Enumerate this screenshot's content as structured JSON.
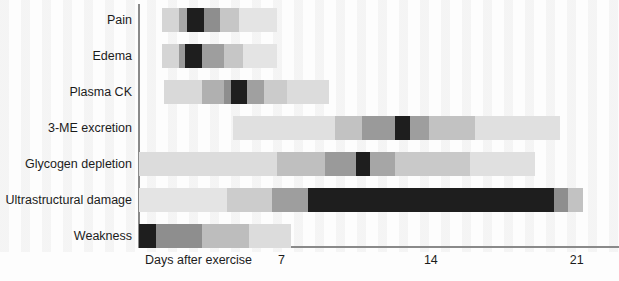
{
  "chart_data": {
    "type": "bar",
    "title": "",
    "subtitle": "",
    "xlabel": "Days after exercise",
    "ylabel": "",
    "xlim": [
      0,
      23
    ],
    "xticks": [
      7,
      14,
      21
    ],
    "xtick_labels": [
      "7",
      "14",
      "21"
    ],
    "grid": false,
    "legend": "none",
    "orientation": "horizontal",
    "categories": [
      "Pain",
      "Edema",
      "Plasma CK",
      "3-ME excretion",
      "Glycogen depletion",
      "Ultrastructural damage",
      "Weakness"
    ],
    "intensity_scale": {
      "levels": [
        "none",
        "very-low",
        "low",
        "medium",
        "high",
        "peak"
      ],
      "colors": [
        "#f2f2f2",
        "#e6e6e6",
        "#d2d2d2",
        "#b4b4b4",
        "#8e8e8e",
        "#1e1e1e"
      ]
    },
    "series": [
      {
        "name": "Pain",
        "start_day": 1.1,
        "end_day": 6.6,
        "peak_day": 2.6,
        "segments": [
          {
            "start_day": 1.1,
            "end_day": 1.9,
            "color": "#d5d5d5",
            "level": "low"
          },
          {
            "start_day": 1.9,
            "end_day": 2.3,
            "color": "#a8a8a8",
            "level": "medium"
          },
          {
            "start_day": 2.3,
            "end_day": 3.1,
            "color": "#1e1e1e",
            "level": "peak"
          },
          {
            "start_day": 3.1,
            "end_day": 3.9,
            "color": "#8e8e8e",
            "level": "high"
          },
          {
            "start_day": 3.9,
            "end_day": 4.8,
            "color": "#c6c6c6",
            "level": "low"
          },
          {
            "start_day": 4.8,
            "end_day": 6.6,
            "color": "#e4e4e4",
            "level": "very-low"
          }
        ]
      },
      {
        "name": "Edema",
        "start_day": 1.1,
        "end_day": 6.6,
        "peak_day": 2.5,
        "segments": [
          {
            "start_day": 1.1,
            "end_day": 1.9,
            "color": "#d5d5d5",
            "level": "low"
          },
          {
            "start_day": 1.9,
            "end_day": 2.2,
            "color": "#9a9a9a",
            "level": "high"
          },
          {
            "start_day": 2.2,
            "end_day": 3.0,
            "color": "#1e1e1e",
            "level": "peak"
          },
          {
            "start_day": 3.0,
            "end_day": 4.1,
            "color": "#9e9e9e",
            "level": "high"
          },
          {
            "start_day": 4.1,
            "end_day": 5.0,
            "color": "#c6c6c6",
            "level": "low"
          },
          {
            "start_day": 5.0,
            "end_day": 6.6,
            "color": "#e4e4e4",
            "level": "very-low"
          }
        ]
      },
      {
        "name": "Plasma CK",
        "start_day": 1.2,
        "end_day": 9.1,
        "peak_day": 4.6,
        "segments": [
          {
            "start_day": 1.2,
            "end_day": 3.0,
            "color": "#d9d9d9",
            "level": "low"
          },
          {
            "start_day": 3.0,
            "end_day": 4.1,
            "color": "#b0b0b0",
            "level": "medium"
          },
          {
            "start_day": 4.1,
            "end_day": 4.4,
            "color": "#8e8e8e",
            "level": "high"
          },
          {
            "start_day": 4.4,
            "end_day": 5.2,
            "color": "#1e1e1e",
            "level": "peak"
          },
          {
            "start_day": 5.2,
            "end_day": 6.0,
            "color": "#a0a0a0",
            "level": "high"
          },
          {
            "start_day": 6.0,
            "end_day": 7.1,
            "color": "#cbcbcb",
            "level": "low"
          },
          {
            "start_day": 7.1,
            "end_day": 9.1,
            "color": "#dcdcdc",
            "level": "very-low"
          }
        ]
      },
      {
        "name": "3-ME excretion",
        "start_day": 4.5,
        "end_day": 20.2,
        "peak_day": 12.6,
        "segments": [
          {
            "start_day": 4.5,
            "end_day": 9.4,
            "color": "#e0e0e0",
            "level": "very-low"
          },
          {
            "start_day": 9.4,
            "end_day": 10.7,
            "color": "#c2c2c2",
            "level": "low"
          },
          {
            "start_day": 10.7,
            "end_day": 12.3,
            "color": "#9a9a9a",
            "level": "high"
          },
          {
            "start_day": 12.3,
            "end_day": 13.0,
            "color": "#1e1e1e",
            "level": "peak"
          },
          {
            "start_day": 13.0,
            "end_day": 13.9,
            "color": "#9e9e9e",
            "level": "high"
          },
          {
            "start_day": 13.9,
            "end_day": 16.1,
            "color": "#c2c2c2",
            "level": "low"
          },
          {
            "start_day": 16.1,
            "end_day": 20.2,
            "color": "#e0e0e0",
            "level": "very-low"
          }
        ]
      },
      {
        "name": "Glycogen depletion",
        "start_day": 0.0,
        "end_day": 19.0,
        "peak_day": 10.7,
        "segments": [
          {
            "start_day": 0.0,
            "end_day": 6.6,
            "color": "#dcdcdc",
            "level": "very-low"
          },
          {
            "start_day": 6.6,
            "end_day": 8.9,
            "color": "#bfbfbf",
            "level": "low"
          },
          {
            "start_day": 8.9,
            "end_day": 10.4,
            "color": "#9a9a9a",
            "level": "high"
          },
          {
            "start_day": 10.4,
            "end_day": 11.1,
            "color": "#1e1e1e",
            "level": "peak"
          },
          {
            "start_day": 11.1,
            "end_day": 12.3,
            "color": "#a6a6a6",
            "level": "high"
          },
          {
            "start_day": 12.3,
            "end_day": 15.9,
            "color": "#c9c9c9",
            "level": "low"
          },
          {
            "start_day": 15.9,
            "end_day": 19.0,
            "color": "#e0e0e0",
            "level": "very-low"
          }
        ]
      },
      {
        "name": "Ultrastructural damage",
        "start_day": 0.0,
        "end_day": 21.3,
        "peak_day": 13.0,
        "segments": [
          {
            "start_day": 0.0,
            "end_day": 4.2,
            "color": "#e4e4e4",
            "level": "very-low"
          },
          {
            "start_day": 4.2,
            "end_day": 6.4,
            "color": "#cccccc",
            "level": "low"
          },
          {
            "start_day": 6.4,
            "end_day": 8.1,
            "color": "#9e9e9e",
            "level": "high"
          },
          {
            "start_day": 8.1,
            "end_day": 19.9,
            "color": "#1e1e1e",
            "level": "peak"
          },
          {
            "start_day": 19.9,
            "end_day": 20.6,
            "color": "#8e8e8e",
            "level": "high"
          },
          {
            "start_day": 20.6,
            "end_day": 21.3,
            "color": "#c2c2c2",
            "level": "low"
          }
        ]
      },
      {
        "name": "Weakness",
        "start_day": 0.0,
        "end_day": 7.3,
        "peak_day": 0.4,
        "segments": [
          {
            "start_day": 0.0,
            "end_day": 0.8,
            "color": "#1e1e1e",
            "level": "peak"
          },
          {
            "start_day": 0.8,
            "end_day": 3.0,
            "color": "#8e8e8e",
            "level": "high"
          },
          {
            "start_day": 3.0,
            "end_day": 5.3,
            "color": "#bdbdbd",
            "level": "low"
          },
          {
            "start_day": 5.3,
            "end_day": 7.3,
            "color": "#dcdcdc",
            "level": "very-low"
          }
        ]
      }
    ]
  },
  "axis": {
    "origin_label": "Days after exercise",
    "ticks": [
      "7",
      "14",
      "21"
    ],
    "line_color": "#8a8a8a"
  }
}
